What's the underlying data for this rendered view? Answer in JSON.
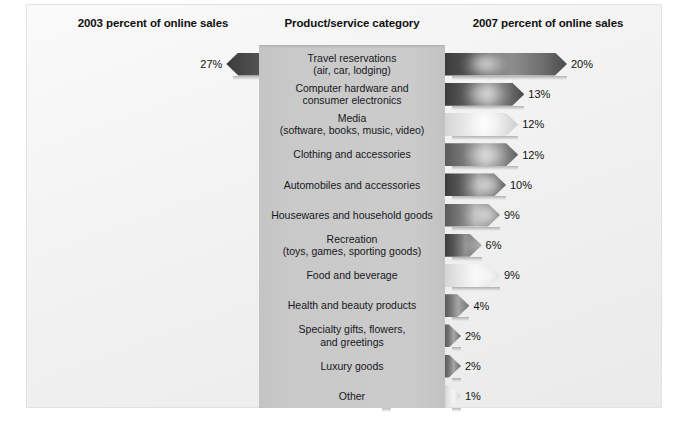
{
  "headers": {
    "left": "2003 percent of online sales",
    "center": "Product/service category",
    "right": "2007 percent of online sales"
  },
  "chart_data": {
    "type": "bar",
    "title": "",
    "subtitle": "",
    "xlabel": "",
    "ylabel": "",
    "grid": false,
    "legend_position": "none",
    "orientation": "horizontal-bidirectional",
    "categories": [
      "Travel reservations (air, car, lodging)",
      "Computer hardware and consumer electronics",
      "Media (software, books, music, video)",
      "Clothing and accessories",
      "Automobiles and accessories",
      "Housewares and household goods",
      "Recreation (toys, games, sporting goods)",
      "Food and beverage",
      "Health and beauty products",
      "Specialty gifts, flowers, and greetings",
      "Luxury goods",
      "Other"
    ],
    "series": [
      {
        "name": "2003 percent of online sales",
        "values": [
          27,
          16,
          14,
          10,
          8,
          7,
          6,
          4,
          4,
          2,
          1,
          1
        ]
      },
      {
        "name": "2007 percent of online sales",
        "values": [
          20,
          13,
          12,
          12,
          10,
          9,
          6,
          9,
          4,
          2,
          2,
          1
        ]
      }
    ],
    "unit": "%",
    "xlim": [
      0,
      27
    ]
  },
  "rows": [
    {
      "label_line1": "Travel reservations",
      "label_line2": "(air, car, lodging)",
      "left_value": "27%",
      "right_value": "20%",
      "left_num": 27,
      "right_num": 20,
      "tone": "dark"
    },
    {
      "label_line1": "Computer hardware and",
      "label_line2": "consumer electronics",
      "left_value": "16%",
      "right_value": "13%",
      "left_num": 16,
      "right_num": 13,
      "tone": "dark"
    },
    {
      "label_line1": "Media",
      "label_line2": "(software, books, music, video)",
      "left_value": "14%",
      "right_value": "12%",
      "left_num": 14,
      "right_num": 12,
      "tone": "light"
    },
    {
      "label_line1": "Clothing and accessories",
      "label_line2": "",
      "left_value": "10%",
      "right_value": "12%",
      "left_num": 10,
      "right_num": 12,
      "tone": "mid"
    },
    {
      "label_line1": "Automobiles and accessories",
      "label_line2": "",
      "left_value": "8%",
      "right_value": "10%",
      "left_num": 8,
      "right_num": 10,
      "tone": "dark"
    },
    {
      "label_line1": "Housewares and household goods",
      "label_line2": "",
      "left_value": "7%",
      "right_value": "9%",
      "left_num": 7,
      "right_num": 9,
      "tone": "mid"
    },
    {
      "label_line1": "Recreation",
      "label_line2": "(toys, games, sporting goods)",
      "left_value": "6%",
      "right_value": "6%",
      "left_num": 6,
      "right_num": 6,
      "tone": "dark"
    },
    {
      "label_line1": "Food and beverage",
      "label_line2": "",
      "left_value": "4%",
      "right_value": "9%",
      "left_num": 4,
      "right_num": 9,
      "tone": "light"
    },
    {
      "label_line1": "Health and beauty products",
      "label_line2": "",
      "left_value": "4%",
      "right_value": "4%",
      "left_num": 4,
      "right_num": 4,
      "tone": "mid"
    },
    {
      "label_line1": "Specialty gifts, flowers,",
      "label_line2": "and greetings",
      "left_value": "2%",
      "right_value": "2%",
      "left_num": 2,
      "right_num": 2,
      "tone": "mid"
    },
    {
      "label_line1": "Luxury goods",
      "label_line2": "",
      "left_value": "1%",
      "right_value": "2%",
      "left_num": 1,
      "right_num": 2,
      "tone": "mid"
    },
    {
      "label_line1": "Other",
      "label_line2": "",
      "left_value": "1%",
      "right_value": "1%",
      "left_num": 1,
      "right_num": 1,
      "tone": "light"
    }
  ]
}
